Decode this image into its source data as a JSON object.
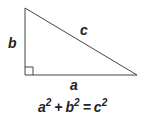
{
  "diagram": {
    "type": "right-triangle",
    "labels": {
      "a": "a",
      "b": "b",
      "c": "c"
    },
    "formula": {
      "a": "a",
      "a_exp": "2",
      "plus": "+",
      "b": "b",
      "b_exp": "2",
      "equals": "=",
      "c": "c",
      "c_exp": "2"
    },
    "colors": {
      "line": "#333333",
      "text": "#222222",
      "background": "#ffffff"
    }
  }
}
